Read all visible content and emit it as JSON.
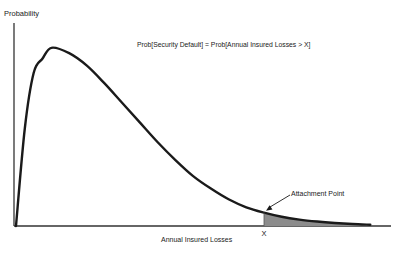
{
  "chart_data": {
    "type": "area",
    "title": "",
    "xlabel": "Annual Insured Losses",
    "ylabel": "Probability",
    "grid": false,
    "legend": "none",
    "series": [
      {
        "name": "Annual insured loss distribution (right-skewed density)",
        "x": [
          0,
          0.5,
          1,
          1.5,
          2,
          3,
          4,
          5,
          6,
          7,
          8,
          9,
          10,
          11,
          12,
          13,
          14,
          15,
          16,
          17,
          18,
          19,
          20
        ],
        "y": [
          0,
          0.55,
          0.86,
          0.94,
          1.0,
          0.97,
          0.9,
          0.8,
          0.69,
          0.58,
          0.47,
          0.37,
          0.28,
          0.21,
          0.15,
          0.105,
          0.075,
          0.052,
          0.036,
          0.025,
          0.017,
          0.011,
          0.007
        ]
      }
    ],
    "xlim": [
      0,
      21
    ],
    "ylim": [
      0,
      1.1
    ],
    "shaded_region": {
      "from_x": 14,
      "label": "Prob[Security Default] = Prob[Annual Insured Losses > X]"
    },
    "annotations": [
      {
        "text": "Prob[Security Default] = Prob[Annual Insured Losses > X]",
        "kind": "formula"
      },
      {
        "text": "Attachment Point",
        "kind": "arrow-label",
        "points_to_x": 14
      },
      {
        "text": "X",
        "kind": "tick-label",
        "at_x": 14
      }
    ],
    "colors": {
      "curve": "#1a1a1a",
      "shade": "#8c8c8c",
      "axes": "#333333"
    }
  }
}
